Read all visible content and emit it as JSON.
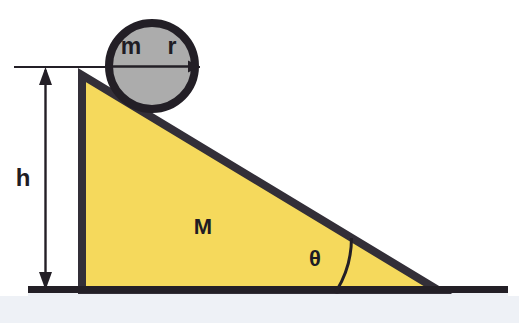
{
  "figure": {
    "kind": "physics-free-body-diagram",
    "background_color": "#FFFFFF",
    "ground_fill_color": "#EDF0F5"
  },
  "labels": {
    "mass_small": "m",
    "radius": "r",
    "mass_large": "M",
    "height": "h",
    "angle": "θ"
  },
  "colors": {
    "incline_fill": "#F5D95C",
    "incline_stroke": "#332F38",
    "circle_fill": "#ACACAC",
    "circle_stroke": "#231F26",
    "ground_line": "#231F26",
    "annotation": "#231F26",
    "ground_area": "#EDF0F5"
  },
  "geometry": {
    "incline": {
      "apex": [
        82,
        75
      ],
      "bottom_left": [
        82,
        290
      ],
      "bottom_right": [
        438,
        290
      ],
      "height_px": 215,
      "base_px": 356,
      "angle_degrees": 31
    },
    "circle": {
      "center": [
        152,
        66
      ],
      "radius_px": 47
    },
    "ground_line": {
      "x_start": 28,
      "x_end": 508,
      "y": 289
    },
    "height_arrow": {
      "x": 45,
      "y_top": 68,
      "y_bottom": 289
    },
    "reference_line": {
      "x_start": 14,
      "x_end": 200,
      "y": 67
    },
    "radius_arrow": {
      "from": [
        152,
        66
      ],
      "to": [
        199,
        66
      ]
    },
    "angle_arc": {
      "vertex": [
        438,
        290
      ],
      "radius_px": 101,
      "sweep_degrees": 31
    }
  },
  "annotations": [
    {
      "name": "mass-small-label",
      "text": "m",
      "x": 131,
      "y": 53
    },
    {
      "name": "radius-label",
      "text": "r",
      "x": 171,
      "y": 53
    },
    {
      "name": "mass-large-label",
      "text": "M",
      "x": 196,
      "y": 233
    },
    {
      "name": "height-label",
      "text": "h",
      "x": 18,
      "y": 185
    },
    {
      "name": "angle-label",
      "text": "θ",
      "x": 309,
      "y": 265
    }
  ]
}
